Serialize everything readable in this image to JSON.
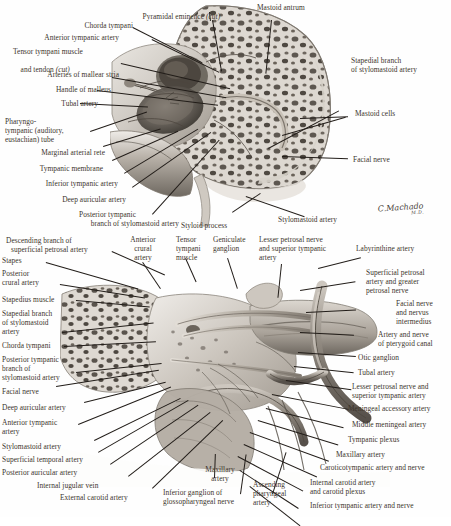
{
  "figure": {
    "signature": "C.Machado",
    "signature_credentials": "M.D.",
    "ink_color": "#3c342c",
    "leader_color": "#221d19",
    "background_color": "#fefefe"
  },
  "panels": [
    {
      "id": "upper",
      "name": "Lateral view of tympanic cavity and mastoid"
    },
    {
      "id": "lower",
      "name": "Inferior/medial view of petrous temporal bone"
    }
  ],
  "labels_upper_left": [
    {
      "text": "Chorda tympani"
    },
    {
      "text": "Anterior tympanic artery"
    },
    {
      "text": "Tensor tympani muscle",
      "text2": "and tendon ",
      "italic2": "(cut)"
    },
    {
      "text": "Arteries of mallear stria"
    },
    {
      "text": "Handle of malleus"
    },
    {
      "text": "Tubal artery"
    },
    {
      "text": "Pharyngo-"
    },
    {
      "text": "tympanic (auditory,"
    },
    {
      "text": "eustachian) tube"
    },
    {
      "text": "Marginal arterial rete"
    },
    {
      "text": "Tympanic membrane"
    },
    {
      "text": "Inferior tympanic artery"
    },
    {
      "text": "Deep auricular artery"
    },
    {
      "text": "Posterior tympanic"
    },
    {
      "text": "branch of stylomastoid artery"
    }
  ],
  "labels_upper_top": [
    {
      "text": "Pyramidal eminence ",
      "italic": "(cut)"
    },
    {
      "text": "Mastoid antrum"
    }
  ],
  "labels_upper_right": [
    {
      "text": "Stapedial branch"
    },
    {
      "text": "of stylomastoid artery"
    },
    {
      "text": "Mastoid cells"
    },
    {
      "text": "Facial nerve"
    }
  ],
  "labels_middle": [
    {
      "text": "Styloid process"
    },
    {
      "text": "Stylomastoid artery"
    },
    {
      "text": "Anterior"
    },
    {
      "text": "crural"
    },
    {
      "text": "artery"
    },
    {
      "text": "Tensor"
    },
    {
      "text": "tympani"
    },
    {
      "text": "muscle"
    },
    {
      "text": "Geniculate"
    },
    {
      "text": "ganglion"
    },
    {
      "text": "Lesser petrosal nerve"
    },
    {
      "text": "and superior tympanic"
    },
    {
      "text": "artery"
    }
  ],
  "labels_lower_left": [
    {
      "text": "Descending branch of"
    },
    {
      "text": "superficial petrosal artery"
    },
    {
      "text": "Stapes"
    },
    {
      "text": "Posterior"
    },
    {
      "text": "crural artery"
    },
    {
      "text": "Stapedius muscle"
    },
    {
      "text": "Stapedial branch"
    },
    {
      "text": "of stylomastoid"
    },
    {
      "text": "artery"
    },
    {
      "text": "Chorda tympani"
    },
    {
      "text": "Posterior tympanic"
    },
    {
      "text": "branch of"
    },
    {
      "text": "stylomastoid artery"
    },
    {
      "text": "Facial nerve"
    },
    {
      "text": "Deep auricular artery"
    },
    {
      "text": "Anterior tympanic"
    },
    {
      "text": "artery"
    },
    {
      "text": "Stylomastoid artery"
    },
    {
      "text": "Superficial temporal artery"
    },
    {
      "text": "Posterior auricular artery"
    },
    {
      "text": "Internal jugular vein"
    },
    {
      "text": "External carotid artery"
    }
  ],
  "labels_lower_bottom": [
    {
      "text": "Maxillary"
    },
    {
      "text": "artery"
    },
    {
      "text": "Inferior ganglion of"
    },
    {
      "text": "glossopharyngeal nerve"
    },
    {
      "text": "Ascending"
    },
    {
      "text": "pharyngeal"
    },
    {
      "text": "artery"
    }
  ],
  "labels_lower_right": [
    {
      "text": "Labyrinthine artery"
    },
    {
      "text": "Superficial petrosal"
    },
    {
      "text": "artery and greater"
    },
    {
      "text": "petrosal nerve"
    },
    {
      "text": "Facial nerve"
    },
    {
      "text": "and nervus"
    },
    {
      "text": "intermedius"
    },
    {
      "text": "Artery and nerve"
    },
    {
      "text": "of pterygoid canal"
    },
    {
      "text": "Otic ganglion"
    },
    {
      "text": "Tubal artery"
    },
    {
      "text": "Lesser petrosal nerve and"
    },
    {
      "text": "superior tympanic artery"
    },
    {
      "text": "Meningeal accessory artery"
    },
    {
      "text": "Middle meningeal artery"
    },
    {
      "text": "Tympanic plexus"
    },
    {
      "text": "Maxillary artery"
    },
    {
      "text": "Caroticotympanic artery and nerve"
    },
    {
      "text": "Internal carotid artery"
    },
    {
      "text": "and carotid plexus"
    },
    {
      "text": "Inferior tympanic artery and nerve"
    }
  ]
}
